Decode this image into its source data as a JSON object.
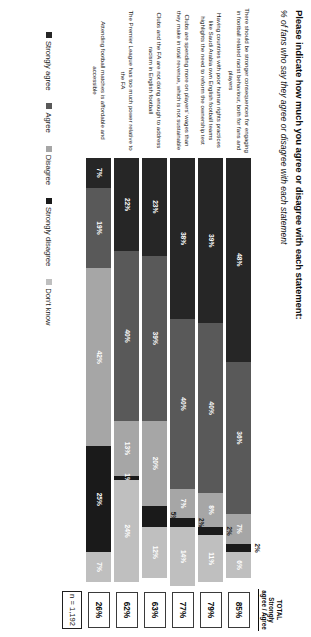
{
  "header": {
    "title": "Please indicate how much you agree or disagree with each statement:",
    "subtitle": "% of fans who say they agree or disagree with each statement",
    "total_column_header": "TOTAL Strongly agree / Agree",
    "base_label": "n = 1,192"
  },
  "chart_data": {
    "type": "bar",
    "orientation": "horizontal-stacked",
    "title": "Please indicate how much you agree or disagree with each statement:",
    "subtitle": "% of fans who say they agree or disagree with each statement",
    "xlabel": "",
    "ylabel": "",
    "xlim": [
      0,
      100
    ],
    "grid": false,
    "legend_position": "bottom",
    "value_suffix": "%",
    "base": "n = 1,192",
    "categories": [
      "There should be stronger consequences for engaging in football related racist behaviour, both for fans and players",
      "Having countries with poor human rights practices like Saudi Arabia own English football teams highlights the need to reform the ownership test",
      "Clubs are spending more on players' wages than they make in total revenue, which is not sustainable",
      "Clubs and the FA are not doing enough to address racism in English football",
      "The Premier League has too much power relative to the FA",
      "Attending football matches is affordable and accessible"
    ],
    "series": [
      {
        "name": "Strongly agree",
        "color": "#262626",
        "values": [
          48,
          39,
          38,
          23,
          22,
          7
        ]
      },
      {
        "name": "Agree",
        "color": "#595959",
        "values": [
          36,
          40,
          40,
          39,
          40,
          19
        ]
      },
      {
        "name": "Disagree",
        "color": "#a6a6a6",
        "values": [
          7,
          8,
          7,
          20,
          13,
          42
        ]
      },
      {
        "name": "Strongly disagree",
        "color": "#1a1a1a",
        "values": [
          2,
          2,
          2,
          5,
          1,
          25
        ]
      },
      {
        "name": "Don't know",
        "color": "#bfbfbf",
        "values": [
          6,
          11,
          14,
          12,
          24,
          7
        ]
      }
    ],
    "totals": {
      "label": "TOTAL Strongly agree / Agree",
      "values": [
        "85%",
        "79%",
        "77%",
        "63%",
        "62%",
        "26%"
      ]
    }
  },
  "rows": [
    {
      "label": "There should be stronger consequences for engaging in football related racist behaviour, both for fans and players",
      "total": "85%",
      "segments": [
        {
          "name": "Strongly agree",
          "value": 48,
          "text": "48%",
          "callout": false,
          "dark_text": false
        },
        {
          "name": "Agree",
          "value": 36,
          "text": "36%",
          "callout": false,
          "dark_text": false
        },
        {
          "name": "Disagree",
          "value": 7,
          "text": "7%",
          "callout": false,
          "dark_text": false
        },
        {
          "name": "Strongly disagree",
          "value": 2,
          "text": "2%",
          "callout": true,
          "dark_text": true
        },
        {
          "name": "Don't know",
          "value": 6,
          "text": "6%",
          "callout": false,
          "dark_text": false
        }
      ]
    },
    {
      "label": "Having countries with poor human rights practices like Saudi Arabia own English football teams highlights the need to reform the ownership test",
      "total": "79%",
      "segments": [
        {
          "name": "Strongly agree",
          "value": 39,
          "text": "39%",
          "callout": false,
          "dark_text": false
        },
        {
          "name": "Agree",
          "value": 40,
          "text": "40%",
          "callout": false,
          "dark_text": false
        },
        {
          "name": "Disagree",
          "value": 8,
          "text": "8%",
          "callout": false,
          "dark_text": false
        },
        {
          "name": "Strongly disagree",
          "value": 2,
          "text": "2%",
          "callout": true,
          "dark_text": true
        },
        {
          "name": "Don't know",
          "value": 11,
          "text": "11%",
          "callout": false,
          "dark_text": false
        }
      ]
    },
    {
      "label": "Clubs are spending more on players' wages than they make in total revenue, which is not sustainable",
      "total": "77%",
      "segments": [
        {
          "name": "Strongly agree",
          "value": 38,
          "text": "38%",
          "callout": false,
          "dark_text": false
        },
        {
          "name": "Agree",
          "value": 40,
          "text": "40%",
          "callout": false,
          "dark_text": false
        },
        {
          "name": "Disagree",
          "value": 7,
          "text": "7%",
          "callout": false,
          "dark_text": false
        },
        {
          "name": "Strongly disagree",
          "value": 2,
          "text": "2%",
          "callout": true,
          "dark_text": true
        },
        {
          "name": "Don't know",
          "value": 14,
          "text": "14%",
          "callout": false,
          "dark_text": false
        }
      ]
    },
    {
      "label": "Clubs and the FA are not doing enough to address racism in English football",
      "total": "63%",
      "segments": [
        {
          "name": "Strongly agree",
          "value": 23,
          "text": "23%",
          "callout": false,
          "dark_text": false
        },
        {
          "name": "Agree",
          "value": 39,
          "text": "39%",
          "callout": false,
          "dark_text": false
        },
        {
          "name": "Disagree",
          "value": 20,
          "text": "20%",
          "callout": false,
          "dark_text": false
        },
        {
          "name": "Strongly disagree",
          "value": 5,
          "text": "5%",
          "callout": true,
          "dark_text": true
        },
        {
          "name": "Don't know",
          "value": 12,
          "text": "12%",
          "callout": false,
          "dark_text": false
        }
      ]
    },
    {
      "label": "The Premier League has too much power relative to the FA",
      "total": "62%",
      "segments": [
        {
          "name": "Strongly agree",
          "value": 22,
          "text": "22%",
          "callout": false,
          "dark_text": false
        },
        {
          "name": "Agree",
          "value": 40,
          "text": "40%",
          "callout": false,
          "dark_text": false
        },
        {
          "name": "Disagree",
          "value": 13,
          "text": "13%",
          "callout": false,
          "dark_text": false
        },
        {
          "name": "Strongly disagree",
          "value": 1,
          "text": "1%",
          "callout": false,
          "dark_text": false
        },
        {
          "name": "Don't know",
          "value": 24,
          "text": "24%",
          "callout": false,
          "dark_text": false
        }
      ]
    },
    {
      "label": "Attending football matches is affordable and accessible",
      "total": "26%",
      "segments": [
        {
          "name": "Strongly agree",
          "value": 7,
          "text": "7%",
          "callout": false,
          "dark_text": false
        },
        {
          "name": "Agree",
          "value": 19,
          "text": "19%",
          "callout": false,
          "dark_text": false
        },
        {
          "name": "Disagree",
          "value": 42,
          "text": "42%",
          "callout": false,
          "dark_text": false
        },
        {
          "name": "Strongly disagree",
          "value": 25,
          "text": "25%",
          "callout": false,
          "dark_text": false
        },
        {
          "name": "Don't know",
          "value": 7,
          "text": "7%",
          "callout": false,
          "dark_text": false
        }
      ]
    }
  ],
  "legend": {
    "items": [
      {
        "label": "Strongly agree",
        "color": "#262626"
      },
      {
        "label": "Agree",
        "color": "#595959"
      },
      {
        "label": "Disagree",
        "color": "#a6a6a6"
      },
      {
        "label": "Strongly disagree",
        "color": "#1a1a1a"
      },
      {
        "label": "Don't know",
        "color": "#bfbfbf"
      }
    ]
  }
}
